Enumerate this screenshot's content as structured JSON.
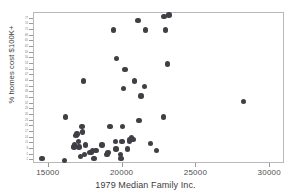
{
  "chart_data": {
    "type": "scatter",
    "title": "",
    "xlabel": "1979 Median Family Inc.",
    "ylabel": "% homes cost $100K+",
    "xlim": [
      14000,
      31000
    ],
    "ylim": [
      0,
      80
    ],
    "xticks": [
      15000,
      20000,
      25000,
      30000
    ],
    "xticklabels": [
      "15000",
      "20000",
      "25000",
      "30000"
    ],
    "yticks": [
      2,
      5,
      8,
      11,
      14,
      17,
      20,
      23,
      26,
      29,
      32,
      35,
      38,
      41,
      44,
      47,
      50,
      53,
      56,
      59,
      62,
      65,
      68,
      71,
      74,
      77
    ],
    "yticklabels": [
      "2",
      "5",
      "8",
      "11",
      "14",
      "17",
      "20",
      "23",
      "26",
      "29",
      "32",
      "35",
      "38",
      "41",
      "44",
      "47",
      "50",
      "53",
      "56",
      "59",
      "62",
      "65",
      "68",
      "71",
      "74",
      "77"
    ],
    "grid": false,
    "legend": null,
    "marker": {
      "shape": "circle",
      "color": "#3f3f45",
      "size": 5.4
    },
    "points": [
      {
        "x": 14550,
        "y": 3
      },
      {
        "x": 16050,
        "y": 2
      },
      {
        "x": 16150,
        "y": 25
      },
      {
        "x": 16700,
        "y": 9
      },
      {
        "x": 16750,
        "y": 10
      },
      {
        "x": 16850,
        "y": 15
      },
      {
        "x": 16900,
        "y": 16
      },
      {
        "x": 17000,
        "y": 12
      },
      {
        "x": 17050,
        "y": 9
      },
      {
        "x": 17150,
        "y": 4
      },
      {
        "x": 17250,
        "y": 20
      },
      {
        "x": 17300,
        "y": 17
      },
      {
        "x": 17350,
        "y": 44
      },
      {
        "x": 17400,
        "y": 5
      },
      {
        "x": 17500,
        "y": 10
      },
      {
        "x": 17750,
        "y": 6
      },
      {
        "x": 17900,
        "y": 6
      },
      {
        "x": 17950,
        "y": 7
      },
      {
        "x": 18050,
        "y": 3
      },
      {
        "x": 18200,
        "y": 7
      },
      {
        "x": 18600,
        "y": 10
      },
      {
        "x": 18950,
        "y": 5
      },
      {
        "x": 19000,
        "y": 6
      },
      {
        "x": 19150,
        "y": 20
      },
      {
        "x": 19400,
        "y": 71
      },
      {
        "x": 19500,
        "y": 12
      },
      {
        "x": 19550,
        "y": 8
      },
      {
        "x": 19600,
        "y": 56
      },
      {
        "x": 19850,
        "y": 5
      },
      {
        "x": 19900,
        "y": 3
      },
      {
        "x": 19950,
        "y": 12
      },
      {
        "x": 20000,
        "y": 20
      },
      {
        "x": 20050,
        "y": 40
      },
      {
        "x": 20150,
        "y": 50
      },
      {
        "x": 20350,
        "y": 8
      },
      {
        "x": 20450,
        "y": 12
      },
      {
        "x": 20500,
        "y": 13
      },
      {
        "x": 20600,
        "y": 14
      },
      {
        "x": 20700,
        "y": 13
      },
      {
        "x": 20800,
        "y": 44
      },
      {
        "x": 21050,
        "y": 76
      },
      {
        "x": 21100,
        "y": 23
      },
      {
        "x": 21250,
        "y": 36
      },
      {
        "x": 21500,
        "y": 41
      },
      {
        "x": 21550,
        "y": 71
      },
      {
        "x": 21900,
        "y": 11
      },
      {
        "x": 22300,
        "y": 7
      },
      {
        "x": 22750,
        "y": 25
      },
      {
        "x": 22800,
        "y": 78
      },
      {
        "x": 22900,
        "y": 71
      },
      {
        "x": 23050,
        "y": 53
      },
      {
        "x": 23150,
        "y": 79
      },
      {
        "x": 28200,
        "y": 33
      }
    ]
  }
}
